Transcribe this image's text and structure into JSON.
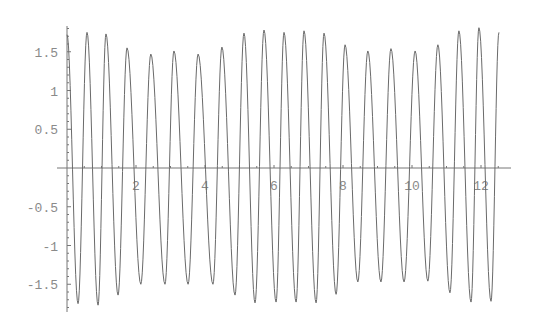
{
  "chart_data": {
    "type": "line",
    "title": "",
    "xlabel": "",
    "ylabel": "",
    "xlim": [
      0,
      12.6
    ],
    "ylim": [
      -1.8,
      1.8
    ],
    "grid": false,
    "legend": null,
    "x_ticks": [
      2,
      4,
      6,
      8,
      10,
      12
    ],
    "x_tick_labels": [
      "2",
      "4",
      "6",
      "8",
      "10",
      "12"
    ],
    "y_ticks": [
      -1.5,
      -1,
      -0.5,
      0.5,
      1,
      1.5
    ],
    "y_tick_labels": [
      "-1.5",
      "-1",
      "-0.5",
      "0.5",
      "1",
      "1.5"
    ],
    "series": [
      {
        "name": "oscillation",
        "color": "#6a6a6a",
        "extrema": [
          {
            "x": 0.0,
            "y": 1.72
          },
          {
            "x": 0.32,
            "y": -1.75
          },
          {
            "x": 0.58,
            "y": 1.75
          },
          {
            "x": 0.9,
            "y": -1.77
          },
          {
            "x": 1.13,
            "y": 1.73
          },
          {
            "x": 1.48,
            "y": -1.64
          },
          {
            "x": 1.74,
            "y": 1.55
          },
          {
            "x": 2.14,
            "y": -1.5
          },
          {
            "x": 2.43,
            "y": 1.47
          },
          {
            "x": 2.84,
            "y": -1.5
          },
          {
            "x": 3.1,
            "y": 1.51
          },
          {
            "x": 3.51,
            "y": -1.5
          },
          {
            "x": 3.8,
            "y": 1.47
          },
          {
            "x": 4.23,
            "y": -1.5
          },
          {
            "x": 4.49,
            "y": 1.56
          },
          {
            "x": 4.87,
            "y": -1.64
          },
          {
            "x": 5.13,
            "y": 1.74
          },
          {
            "x": 5.45,
            "y": -1.74
          },
          {
            "x": 5.71,
            "y": 1.78
          },
          {
            "x": 6.06,
            "y": -1.73
          },
          {
            "x": 6.29,
            "y": 1.75
          },
          {
            "x": 6.64,
            "y": -1.73
          },
          {
            "x": 6.87,
            "y": 1.77
          },
          {
            "x": 7.22,
            "y": -1.74
          },
          {
            "x": 7.45,
            "y": 1.74
          },
          {
            "x": 7.8,
            "y": -1.63
          },
          {
            "x": 8.06,
            "y": 1.59
          },
          {
            "x": 8.43,
            "y": -1.47
          },
          {
            "x": 8.72,
            "y": 1.51
          },
          {
            "x": 9.1,
            "y": -1.47
          },
          {
            "x": 9.39,
            "y": 1.54
          },
          {
            "x": 9.77,
            "y": -1.47
          },
          {
            "x": 10.09,
            "y": 1.51
          },
          {
            "x": 10.46,
            "y": -1.46
          },
          {
            "x": 10.75,
            "y": 1.59
          },
          {
            "x": 11.1,
            "y": -1.61
          },
          {
            "x": 11.36,
            "y": 1.77
          },
          {
            "x": 11.71,
            "y": -1.73
          },
          {
            "x": 11.94,
            "y": 1.81
          },
          {
            "x": 12.29,
            "y": -1.72
          },
          {
            "x": 12.52,
            "y": 1.75
          }
        ]
      }
    ]
  },
  "layout": {
    "origin_px": [
      67,
      168
    ],
    "px_per_x": 34.5,
    "px_per_y": 77.5,
    "x_axis_end_px": 511,
    "y_axis_top_px": 26,
    "y_axis_bottom_px": 312
  }
}
